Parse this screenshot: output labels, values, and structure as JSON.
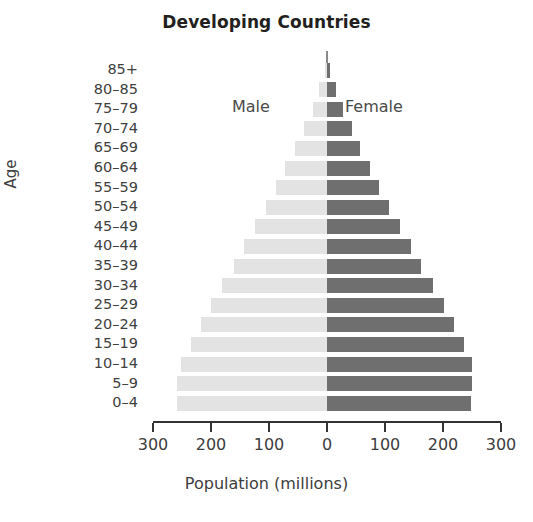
{
  "chart_data": {
    "type": "bar",
    "subtype": "population-pyramid",
    "title": "Developing Countries",
    "xlabel": "Population (millions)",
    "ylabel": "Age",
    "grid": false,
    "legend_position": "inside-plot",
    "axis_ticks_x": [
      "300",
      "200",
      "100",
      "0",
      "100",
      "200",
      "300"
    ],
    "xlim": [
      -300,
      300
    ],
    "x_tick_values": [
      -300,
      -200,
      -100,
      0,
      100,
      200,
      300
    ],
    "categories": [
      "85+",
      "80–85",
      "75–79",
      "70–74",
      "65–69",
      "60–64",
      "55–59",
      "50–54",
      "45–49",
      "40–44",
      "35–39",
      "30–34",
      "25–29",
      "20–24",
      "15–19",
      "10–14",
      "5–9",
      "0–4"
    ],
    "series": [
      {
        "name": "Male",
        "color": "#e3e3e3",
        "side": "left",
        "values": [
          4,
          14,
          24,
          40,
          55,
          72,
          88,
          105,
          124,
          143,
          160,
          181,
          200,
          217,
          235,
          252,
          258,
          259
        ]
      },
      {
        "name": "Female",
        "color": "#6f6f6f",
        "side": "right",
        "values": [
          5,
          16,
          28,
          43,
          57,
          74,
          90,
          107,
          126,
          145,
          162,
          183,
          202,
          219,
          236,
          250,
          250,
          248
        ]
      }
    ],
    "annotations": [
      {
        "text": "Male",
        "position": "upper-left-of-center"
      },
      {
        "text": "Female",
        "position": "upper-right-of-center"
      }
    ]
  },
  "colors": {
    "male": "#e3e3e3",
    "female": "#6f6f6f",
    "axis": "#333333",
    "text": "#3d3d3d",
    "title": "#231f20",
    "background": "#ffffff"
  }
}
